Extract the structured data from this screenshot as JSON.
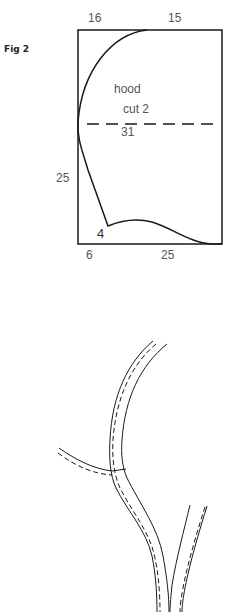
{
  "figure": {
    "label": "Fig 2"
  },
  "pattern": {
    "name": "hood",
    "instruction": "cut 2",
    "dims": {
      "top_left": "16",
      "top_right": "15",
      "fold_line": "31",
      "left_side": "25",
      "corner": "4",
      "bottom_left": "6",
      "bottom_right": "25"
    }
  },
  "colors": {
    "line": "#1a1a1a",
    "label": "#555555"
  }
}
